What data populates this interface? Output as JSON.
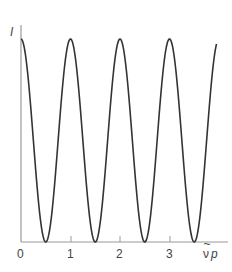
{
  "chart_data": {
    "type": "line",
    "title": "",
    "xlabel": "ν̃p",
    "ylabel": "I",
    "xlim": [
      0,
      4
    ],
    "ylim": [
      0,
      1
    ],
    "x_ticks": [
      "0",
      "1",
      "2",
      "3"
    ],
    "grid": false,
    "legend": null,
    "function": "I = cos²(π ν̃p)",
    "series": [
      {
        "name": "I",
        "x": [
          0,
          0.25,
          0.5,
          0.75,
          1,
          1.25,
          1.5,
          1.75,
          2,
          2.25,
          2.5,
          2.75,
          3,
          3.25,
          3.5,
          3.75,
          3.95
        ],
        "values": [
          1,
          0.5,
          0,
          0.5,
          1,
          0.5,
          0,
          0.5,
          1,
          0.5,
          0,
          0.5,
          1,
          0.5,
          0,
          0.5,
          0.98
        ]
      }
    ],
    "colors": {
      "curve": "#333333",
      "axis": "#999999",
      "text": "#444444"
    }
  },
  "axes": {
    "x_label_main": "ν̃",
    "x_label_tilde_base": "ν",
    "x_label_p": "p",
    "y_label": "I",
    "ticks": [
      "0",
      "1",
      "2",
      "3"
    ]
  }
}
